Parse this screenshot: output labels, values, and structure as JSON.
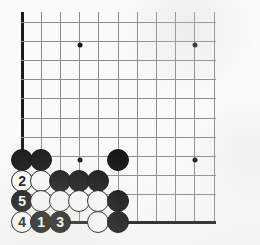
{
  "diagram": {
    "type": "go-board-corner-diagram",
    "board": {
      "origin_x": 22,
      "origin_y": 22,
      "spacing": 19.2,
      "cols": 11,
      "rows": 11,
      "edges": [
        "left",
        "bottom"
      ],
      "line_color": "#8d8d8d",
      "edge_color": "#1b1b1b",
      "background_color": "#fbfbfa"
    },
    "star_points": [
      {
        "name": "star-point-upper-left",
        "col": 3,
        "row": 1.2
      },
      {
        "name": "star-point-upper-right",
        "col": 9,
        "row": 1.2
      },
      {
        "name": "star-point-lower-left",
        "col": 3,
        "row": 7.2
      },
      {
        "name": "star-point-lower-right",
        "col": 9,
        "row": 7.2
      }
    ],
    "stones": [
      {
        "name": "stone-black-a",
        "color": "black",
        "label": "",
        "x": 22,
        "y": 160
      },
      {
        "name": "stone-black-b",
        "color": "black",
        "label": "",
        "x": 41,
        "y": 160
      },
      {
        "name": "stone-black-c",
        "color": "black",
        "label": "",
        "x": 118,
        "y": 160
      },
      {
        "name": "stone-white-move-2",
        "color": "white",
        "label": "2",
        "x": 22,
        "y": 181
      },
      {
        "name": "stone-white-d",
        "color": "white",
        "label": "",
        "x": 41,
        "y": 181
      },
      {
        "name": "stone-black-e",
        "color": "black",
        "label": "",
        "x": 60,
        "y": 181
      },
      {
        "name": "stone-black-f",
        "color": "black",
        "label": "",
        "x": 79,
        "y": 181
      },
      {
        "name": "stone-black-g",
        "color": "black",
        "label": "",
        "x": 98,
        "y": 181
      },
      {
        "name": "stone-black-move-5",
        "color": "black",
        "label": "5",
        "x": 22,
        "y": 201
      },
      {
        "name": "stone-white-h",
        "color": "white",
        "label": "",
        "x": 41,
        "y": 201
      },
      {
        "name": "stone-white-i",
        "color": "white",
        "label": "",
        "x": 60,
        "y": 201
      },
      {
        "name": "stone-white-j",
        "color": "white",
        "label": "",
        "x": 79,
        "y": 201
      },
      {
        "name": "stone-white-k",
        "color": "white",
        "label": "",
        "x": 98,
        "y": 201
      },
      {
        "name": "stone-black-l",
        "color": "black",
        "label": "",
        "x": 118,
        "y": 201
      },
      {
        "name": "stone-white-move-4",
        "color": "white",
        "label": "4",
        "x": 22,
        "y": 222
      },
      {
        "name": "stone-black-move-1",
        "color": "black",
        "label": "1",
        "x": 41,
        "y": 222
      },
      {
        "name": "stone-black-move-3",
        "color": "black",
        "label": "3",
        "x": 60,
        "y": 222
      },
      {
        "name": "stone-white-m",
        "color": "white",
        "label": "",
        "x": 98,
        "y": 222
      },
      {
        "name": "stone-black-n",
        "color": "black",
        "label": "",
        "x": 118,
        "y": 222
      }
    ],
    "move_sequence": [
      {
        "number": "1",
        "color": "black"
      },
      {
        "number": "2",
        "color": "white"
      },
      {
        "number": "3",
        "color": "black"
      },
      {
        "number": "4",
        "color": "white"
      },
      {
        "number": "5",
        "color": "black"
      }
    ]
  }
}
